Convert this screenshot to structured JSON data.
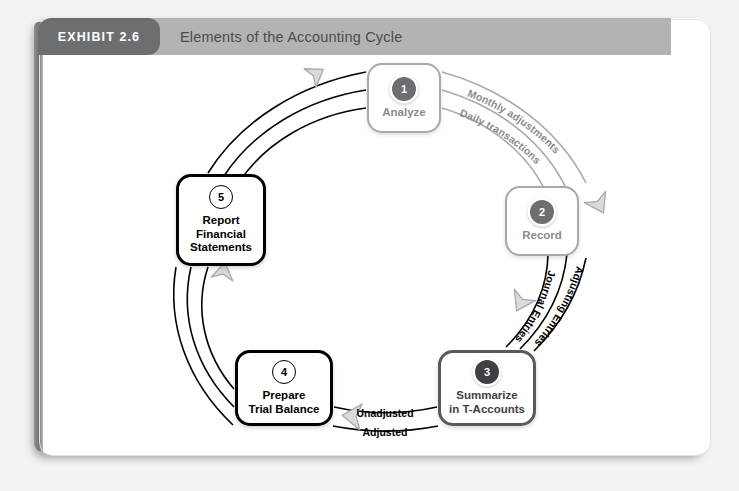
{
  "exhibit": {
    "tab_label": "EXHIBIT 2.6",
    "title": "Elements of the Accounting Cycle"
  },
  "diagram": {
    "type": "cycle",
    "nodes": [
      {
        "number": "1",
        "label": "Analyze",
        "style": "gray"
      },
      {
        "number": "2",
        "label": "Record",
        "style": "gray"
      },
      {
        "number": "3",
        "label": "Summarize\nin T-Accounts",
        "style": "mid"
      },
      {
        "number": "4",
        "label": "Prepare\nTrial Balance",
        "style": "dark"
      },
      {
        "number": "5",
        "label": "Report\nFinancial\nStatements",
        "style": "dark"
      }
    ],
    "flow_labels": {
      "monthly_adjustments": "Monthly adjustments",
      "daily_transactions": "Daily transactions",
      "journal_entries": "Journal Entries",
      "adjusting_entries": "Adjusting Entries",
      "unadjusted": "Unadjusted",
      "adjusted": "Adjusted"
    },
    "colors": {
      "header_bar": "#b3b3b3",
      "exhibit_tab": "#6d6e70",
      "arc_gray": "#a7a9ac",
      "arc_dark": "#000000",
      "arrow_fill": "#d9dadb",
      "arrow_stroke": "#a7a9ac"
    }
  }
}
